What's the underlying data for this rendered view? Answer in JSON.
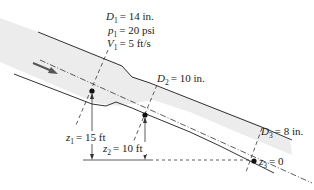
{
  "section1": {
    "diameter": {
      "symbol": "D",
      "sub": "1",
      "value": "= 14 in."
    },
    "pressure": {
      "symbol": "p",
      "sub": "1",
      "value": "= 20 psi"
    },
    "velocity": {
      "symbol": "V",
      "sub": "1",
      "value": "= 5 ft/s"
    },
    "elevation": {
      "symbol": "z",
      "sub": "1",
      "value": "= 15 ft"
    }
  },
  "section2": {
    "diameter": {
      "symbol": "D",
      "sub": "2",
      "value": "= 10 in."
    },
    "elevation": {
      "symbol": "z",
      "sub": "2",
      "value": "= 10 ft"
    }
  },
  "section3": {
    "diameter": {
      "symbol": "D",
      "sub": "3",
      "value": "= 8 in."
    },
    "elevation": {
      "symbol": "z",
      "sub": "3",
      "value": "= 0"
    }
  },
  "colors": {
    "pipe_fill": "#ececec",
    "line": "#333333",
    "flow_arrow": "#555555"
  }
}
